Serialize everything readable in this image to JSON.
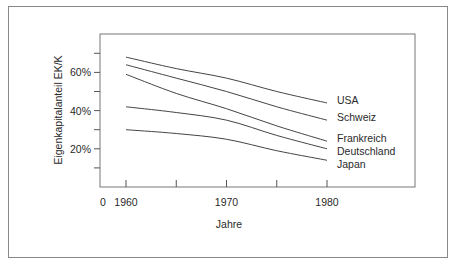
{
  "chart_data": {
    "type": "line",
    "title": "",
    "xlabel": "Jahre",
    "ylabel": "Eigenkapitalanteil EK/K",
    "xlim": [
      1955,
      1990
    ],
    "ylim": [
      0,
      70
    ],
    "x_origin_label": "0",
    "x_ticks": [
      1960,
      1965,
      1970,
      1975,
      1980
    ],
    "x_tick_labels": [
      "1960",
      "",
      "1970",
      "",
      "1980"
    ],
    "y_ticks": [
      10,
      20,
      30,
      40,
      50,
      60,
      70
    ],
    "y_tick_labels": [
      "",
      "20%",
      "",
      "40%",
      "",
      "60%",
      ""
    ],
    "grid": false,
    "legend": "inline-right",
    "x": [
      1960,
      1965,
      1970,
      1975,
      1980
    ],
    "series": [
      {
        "name": "USA",
        "values": [
          68,
          62,
          57,
          50,
          44
        ]
      },
      {
        "name": "Schweiz",
        "values": [
          64,
          57,
          50,
          42,
          35
        ]
      },
      {
        "name": "Frankreich",
        "values": [
          59,
          49,
          41,
          32,
          24
        ]
      },
      {
        "name": "Deutschland",
        "values": [
          42,
          39,
          35,
          27,
          20
        ]
      },
      {
        "name": "Japan",
        "values": [
          30,
          28,
          25,
          19,
          14
        ]
      }
    ]
  }
}
